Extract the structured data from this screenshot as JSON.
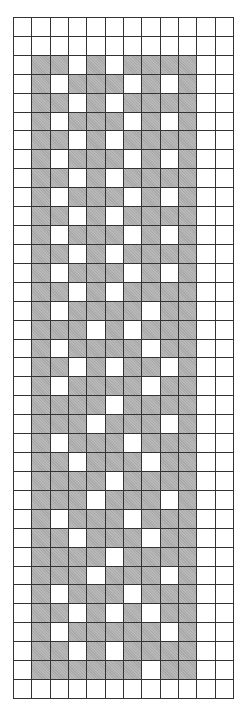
{
  "pattern": {
    "columns": 12,
    "rows": 36,
    "colors": {
      "filled": "#a9a9a9",
      "empty": "#ffffff",
      "grid_line": "#333333"
    },
    "grid": [
      "000000000000",
      "000000000000",
      "011010111100",
      "010111010100",
      "011010111100",
      "010111010100",
      "011010111100",
      "010111010100",
      "011010111100",
      "010111010100",
      "011010111100",
      "010111010100",
      "011010111100",
      "010111010100",
      "011010111100",
      "010111101100",
      "011101011100",
      "010111101100",
      "011010110100",
      "010111101100",
      "011110111100",
      "011101110100",
      "010111011100",
      "011011101100",
      "011110111100",
      "011101110100",
      "010111011100",
      "011011101100",
      "011110111100",
      "011101110100",
      "010111011100",
      "011010101100",
      "010111110100",
      "011010111100",
      "011111101100",
      "000000000000"
    ]
  }
}
